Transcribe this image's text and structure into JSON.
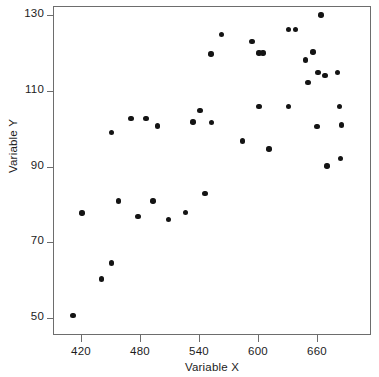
{
  "chart_data": {
    "type": "scatter",
    "title": "",
    "xlabel": "Variable X",
    "ylabel": "Variable Y",
    "xlim": [
      405,
      700
    ],
    "ylim": [
      47,
      133
    ],
    "grid": false,
    "legend": null,
    "xticks": [
      420,
      480,
      540,
      600,
      660
    ],
    "yticks": [
      50,
      70,
      90,
      110,
      130
    ],
    "xtick_labels": [
      "420",
      "480",
      "540",
      "600",
      "660"
    ],
    "ytick_labels": [
      "50",
      "70",
      "90",
      "110",
      "130"
    ],
    "marker": {
      "shape": "circle",
      "color": "#141414",
      "size": 5.4
    },
    "frame_color": "#6d6d6d",
    "background": "#ffffff",
    "n_points": 45,
    "points": [
      {
        "x": 411,
        "y": 50.9
      },
      {
        "x": 420,
        "y": 78.0
      },
      {
        "x": 440,
        "y": 60.6
      },
      {
        "x": 450,
        "y": 64.8
      },
      {
        "x": 450,
        "y": 99.2
      },
      {
        "x": 457,
        "y": 81.2
      },
      {
        "x": 470,
        "y": 103.0
      },
      {
        "x": 477,
        "y": 77.0
      },
      {
        "x": 485,
        "y": 103.0
      },
      {
        "x": 492,
        "y": 81.2
      },
      {
        "x": 497,
        "y": 101.0
      },
      {
        "x": 508,
        "y": 76.2
      },
      {
        "x": 525,
        "y": 78.2
      },
      {
        "x": 533,
        "y": 102.0
      },
      {
        "x": 540,
        "y": 105.0
      },
      {
        "x": 545,
        "y": 83.2
      },
      {
        "x": 551,
        "y": 120.0
      },
      {
        "x": 552,
        "y": 101.9
      },
      {
        "x": 562,
        "y": 125.1
      },
      {
        "x": 583,
        "y": 97.0
      },
      {
        "x": 593,
        "y": 123.3
      },
      {
        "x": 600,
        "y": 120.2
      },
      {
        "x": 604,
        "y": 120.2
      },
      {
        "x": 600,
        "y": 106.1
      },
      {
        "x": 610,
        "y": 94.9
      },
      {
        "x": 630,
        "y": 126.4
      },
      {
        "x": 630,
        "y": 106.1
      },
      {
        "x": 637,
        "y": 126.4
      },
      {
        "x": 647,
        "y": 118.4
      },
      {
        "x": 655,
        "y": 120.5
      },
      {
        "x": 650,
        "y": 112.4
      },
      {
        "x": 663,
        "y": 130.3
      },
      {
        "x": 660,
        "y": 115.1
      },
      {
        "x": 667,
        "y": 114.3
      },
      {
        "x": 659,
        "y": 100.9
      },
      {
        "x": 669,
        "y": 90.4
      },
      {
        "x": 680,
        "y": 115.1
      },
      {
        "x": 682,
        "y": 106.1
      },
      {
        "x": 684,
        "y": 101.2
      },
      {
        "x": 683,
        "y": 92.4
      }
    ]
  }
}
